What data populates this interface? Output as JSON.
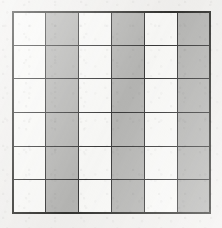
{
  "figure": {
    "kind": "shaded-grid-diagram",
    "rows": 6,
    "columns": 6,
    "total_cells": 36,
    "shaded_cells": 18,
    "unshaded_cells": 18,
    "shaded_fraction": "18/36",
    "pattern_description": "vertical stripes; every second column shaded",
    "shaded_columns": [
      2,
      4,
      6
    ],
    "unshaded_columns": [
      1,
      3,
      5
    ],
    "colors": {
      "background": "#f2f1ef",
      "shaded": "#b6b6b4",
      "unshaded": "#fafaf8",
      "grid_line": "#3a3a3a",
      "outer_border": "#32322f"
    },
    "cells": [
      [
        "white",
        "gray",
        "white",
        "gray",
        "white",
        "gray"
      ],
      [
        "white",
        "gray",
        "white",
        "gray",
        "white",
        "gray"
      ],
      [
        "white",
        "gray",
        "white",
        "gray",
        "white",
        "gray"
      ],
      [
        "white",
        "gray",
        "white",
        "gray",
        "white",
        "gray"
      ],
      [
        "white",
        "gray",
        "white",
        "gray",
        "white",
        "gray"
      ],
      [
        "white",
        "gray",
        "white",
        "gray",
        "white",
        "gray"
      ]
    ]
  }
}
